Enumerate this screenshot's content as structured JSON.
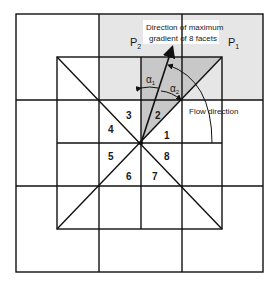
{
  "diagram": {
    "title_line1": "Direction of maximum",
    "title_line2": "gradient of 8 facets",
    "point_p2": "P",
    "point_p2_sub": "2",
    "point_p1": "P",
    "point_p1_sub": "1",
    "alpha1": "α",
    "alpha1_sub": "1",
    "alpha2": "α",
    "alpha2_sub": "2",
    "flow_direction_label": "Flow direction",
    "facets": [
      "1",
      "2",
      "3",
      "4",
      "5",
      "6",
      "7",
      "8"
    ],
    "colors": {
      "line": "#111111",
      "light_shade": "#e6e6e6",
      "dark_shade": "#c8c8c8",
      "background": "#ffffff"
    }
  }
}
